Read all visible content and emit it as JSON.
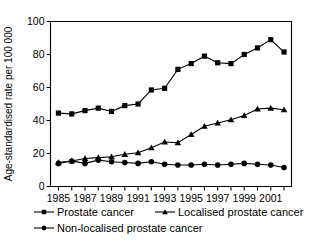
{
  "chart_data": {
    "type": "line",
    "title": "",
    "xlabel": "",
    "ylabel": "Age-standardised rate per 100 000",
    "xlim": [
      1984.4,
      2002.6
    ],
    "ylim": [
      0,
      100
    ],
    "yticks": [
      0,
      20,
      40,
      60,
      80,
      100
    ],
    "ytick_labels": [
      "0",
      "20",
      "40",
      "60",
      "80",
      "100"
    ],
    "x": [
      1985,
      1986,
      1987,
      1988,
      1989,
      1990,
      1991,
      1992,
      1993,
      1994,
      1995,
      1996,
      1997,
      1998,
      1999,
      2000,
      2001,
      2002
    ],
    "xtick_labels": [
      "1985",
      "",
      "1987",
      "",
      "1989",
      "",
      "1991",
      "",
      "1993",
      "",
      "1995",
      "",
      "1997",
      "",
      "1999",
      "",
      "2001",
      ""
    ],
    "xtick_labels_shown": [
      "1985",
      "1987",
      "1989",
      "1991",
      "1993",
      "1995",
      "1997",
      "1999",
      "2001"
    ],
    "grid": false,
    "legend_position": "below",
    "series": [
      {
        "name": "Prostate cancer",
        "marker": "square",
        "color": "#000000",
        "values": [
          44.5,
          44.0,
          46.0,
          47.5,
          45.5,
          49.0,
          50.0,
          58.5,
          59.5,
          71.0,
          74.5,
          79.0,
          75.0,
          74.5,
          80.0,
          84.0,
          89.0,
          81.5
        ]
      },
      {
        "name": "Localised prostate cancer",
        "marker": "triangle",
        "color": "#000000",
        "values": [
          14.5,
          15.5,
          17.0,
          17.5,
          18.0,
          19.5,
          20.5,
          23.5,
          27.0,
          26.5,
          31.5,
          36.5,
          38.5,
          40.5,
          43.0,
          47.0,
          47.5,
          46.5
        ]
      },
      {
        "name": "Non-localised prostate cancer",
        "marker": "circle",
        "color": "#000000",
        "values": [
          14.0,
          15.5,
          14.0,
          16.0,
          15.0,
          14.5,
          14.0,
          15.0,
          13.5,
          13.0,
          13.0,
          13.5,
          13.0,
          13.5,
          14.0,
          13.5,
          13.0,
          11.5
        ]
      }
    ]
  },
  "legend": {
    "items": [
      {
        "label": "Prostate cancer",
        "marker": "square"
      },
      {
        "label": "Localised prostate cancer",
        "marker": "triangle"
      },
      {
        "label": "Non-localised prostate cancer",
        "marker": "circle"
      }
    ]
  }
}
